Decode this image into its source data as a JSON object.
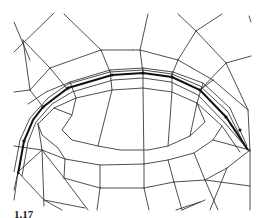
{
  "figure": {
    "type": "quad-mesh",
    "stroke_color": "#3a3a3a",
    "highlight_color": "#111111",
    "background": "#ffffff"
  },
  "caption": {
    "text": "1.17"
  }
}
